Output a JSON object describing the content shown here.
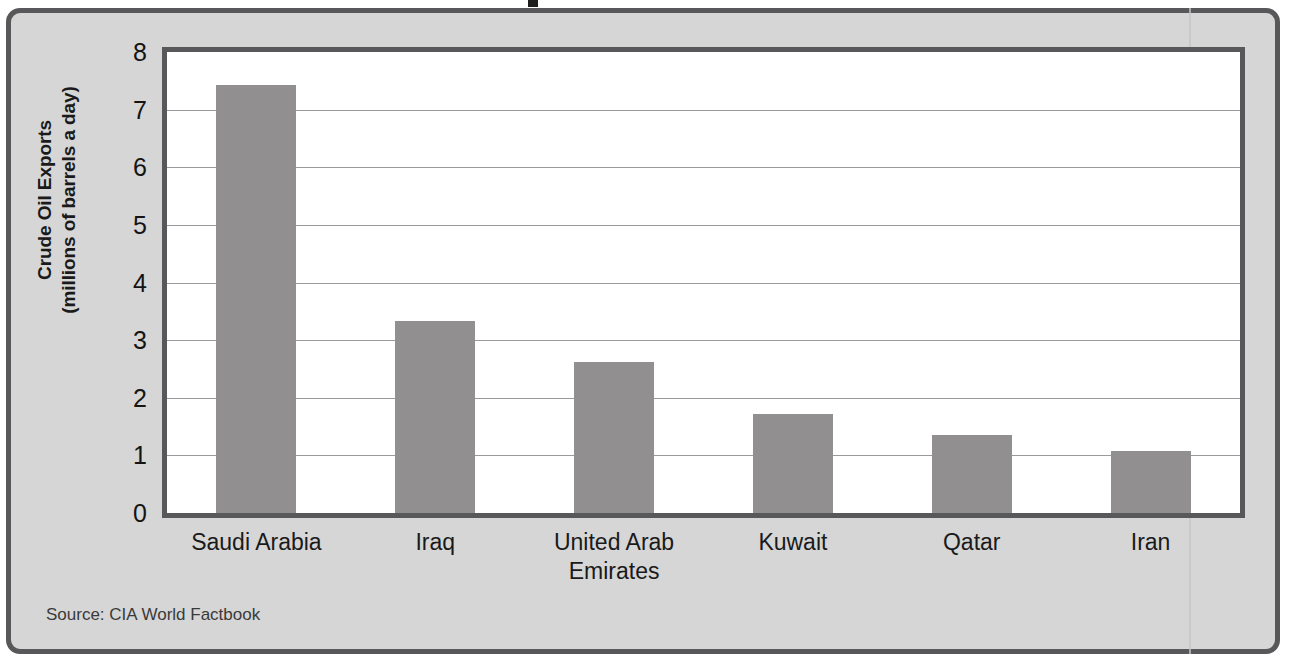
{
  "figure": {
    "source_note": "Source: CIA World Factbook",
    "title_fragment": "",
    "colors": {
      "bar_fill": "#918f90",
      "card_background": "#d6d6d6",
      "frame_border": "#58585a",
      "plot_background": "#ffffff",
      "gridline": "#9a9a9a",
      "text": "#1a1a1a"
    }
  },
  "chart_data": {
    "type": "bar",
    "title": "",
    "categories": [
      "Saudi Arabia",
      "Iraq",
      "United Arab Emirates",
      "Kuwait",
      "Qatar",
      "Iran"
    ],
    "category_lines": [
      [
        "Saudi Arabia"
      ],
      [
        "Iraq"
      ],
      [
        "United Arab",
        "Emirates"
      ],
      [
        "Kuwait"
      ],
      [
        "Qatar"
      ],
      [
        "Iran"
      ]
    ],
    "values": [
      7.43,
      3.33,
      2.62,
      1.72,
      1.35,
      1.07
    ],
    "xlabel": "",
    "ylabel": "Crude Oil Exports",
    "ylabel_line1": "Crude Oil Exports",
    "ylabel_line2": "(millions of barrels a day)",
    "ylim": [
      0,
      8
    ],
    "yticks": [
      8,
      7,
      6,
      5,
      4,
      3,
      2,
      1,
      0
    ],
    "ytick_labels": [
      "8",
      "7",
      "6",
      "5",
      "4",
      "3",
      "2",
      "1",
      "0"
    ],
    "grid": true,
    "grid_axis": "y",
    "legend": false,
    "units": "millions of barrels a day"
  }
}
